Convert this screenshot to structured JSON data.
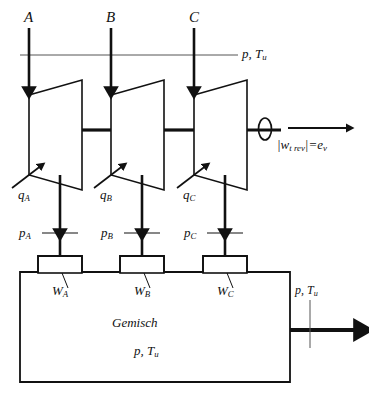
{
  "diagram": {
    "colors": {
      "ink": "#111111",
      "thin": "#555555",
      "background": "#ffffff"
    },
    "ambient_line": {
      "label": "p, T",
      "label_sub": "u"
    },
    "streams": [
      {
        "id": "A",
        "inlet_label": "A",
        "heat_label": "q",
        "heat_sub": "A",
        "pressure_label": "p",
        "pressure_sub": "A",
        "nozzle_label": "W",
        "nozzle_sub": "A"
      },
      {
        "id": "B",
        "inlet_label": "B",
        "heat_label": "q",
        "heat_sub": "B",
        "pressure_label": "p",
        "pressure_sub": "B",
        "nozzle_label": "W",
        "nozzle_sub": "B"
      },
      {
        "id": "C",
        "inlet_label": "C",
        "heat_label": "q",
        "heat_sub": "C",
        "pressure_label": "p",
        "pressure_sub": "C",
        "nozzle_label": "W",
        "nozzle_sub": "C"
      }
    ],
    "shaft_work": {
      "bar_open": "|",
      "symbol": "w",
      "symbol_sub": "t rev",
      "bar_close": "|",
      "equals": "=",
      "result": "e",
      "result_sub": "v"
    },
    "tank": {
      "line1": "Gemisch",
      "line2": "p, T",
      "line2_sub": "u"
    },
    "outlet": {
      "label": "p, T",
      "label_sub": "u"
    }
  }
}
